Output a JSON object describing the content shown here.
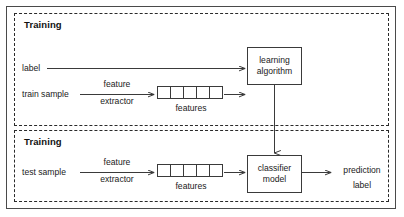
{
  "figure": {
    "background_color": "#ffffff",
    "line_color": "#3a3a3a",
    "text_color": "#1a1a1a",
    "outer_frame_color": "#4a4a4a",
    "panel_border_style": "dashed"
  },
  "panels": [
    {
      "id": "training",
      "title": "Training",
      "inputs": [
        {
          "id": "label",
          "label": "label"
        },
        {
          "id": "train-sample",
          "label": "train sample"
        }
      ],
      "extractor": {
        "line1": "feature",
        "line2": "extractor"
      },
      "features": {
        "label": "features",
        "cell_count": 5
      },
      "model": {
        "line1": "learning",
        "line2": "algorithm"
      }
    },
    {
      "id": "testing",
      "title": "Training",
      "inputs": [
        {
          "id": "test-sample",
          "label": "test sample"
        }
      ],
      "extractor": {
        "line1": "feature",
        "line2": "extractor"
      },
      "features": {
        "label": "features",
        "cell_count": 5
      },
      "model": {
        "line1": "classifier",
        "line2": "model"
      },
      "output": {
        "line1": "prediction",
        "line2": "label"
      }
    }
  ]
}
